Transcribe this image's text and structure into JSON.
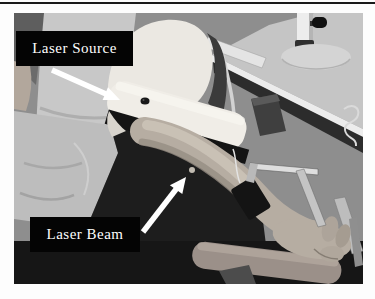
{
  "figure": {
    "annotations": {
      "laser_source_label": "Laser Source",
      "laser_beam_label": "Laser Beam"
    },
    "device_brand_text": "LISCA",
    "colors": {
      "annotation_background": "#000000",
      "annotation_text": "#ffffff",
      "arrow": "#ffffff",
      "page_rule": "#1a1a1a"
    }
  }
}
